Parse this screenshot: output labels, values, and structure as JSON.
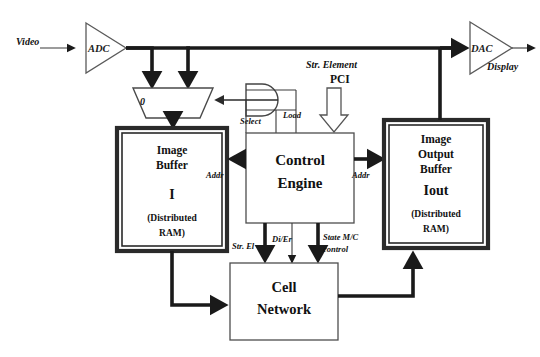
{
  "diagram": {
    "background_color": "#ffffff",
    "line_color": "#1a1a1a",
    "signals": {
      "video_in": "Video",
      "display_out": "Display",
      "select": "Select",
      "load": "Load",
      "addr_left": "Addr",
      "addr_right": "Addr",
      "str_element": "Str. Element",
      "pci": "PCI",
      "str_el": "Str. El",
      "di_er": "Di/Er",
      "state_mc": "State M/C",
      "state_mc_control": "control",
      "mux_input_zero": "0"
    },
    "components": {
      "adc": {
        "label": "ADC",
        "shape": "triangle"
      },
      "dac": {
        "label": "DAC",
        "shape": "triangle"
      },
      "mux": {
        "label": "multiplexer",
        "shape": "trapezoid"
      },
      "and_gate": {
        "label": "AND gate",
        "shape": "and-gate"
      },
      "image_buffer": {
        "line1": "Image",
        "line2": "Buffer",
        "line3": "I",
        "line4": "(Distributed",
        "line5": "RAM)"
      },
      "control_engine": {
        "line1": "Control",
        "line2": "Engine"
      },
      "image_output_buffer": {
        "line1": "Image",
        "line2": "Output",
        "line3": "Buffer",
        "line4": "Iout",
        "line5": "(Distributed",
        "line6": "RAM)"
      },
      "cell_network": {
        "line1": "Cell",
        "line2": "Network"
      }
    }
  }
}
